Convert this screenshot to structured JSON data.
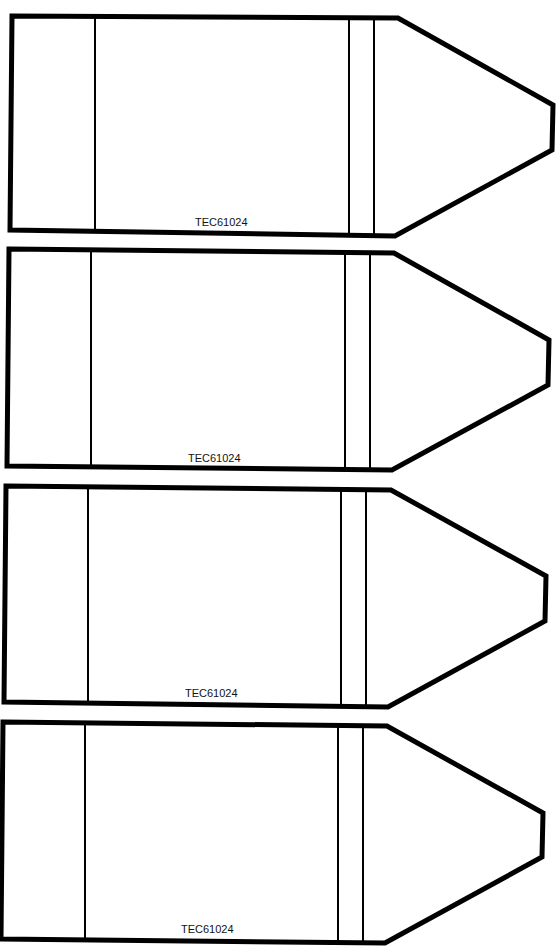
{
  "sheet": {
    "background": "#ffffff",
    "stroke_color": "#000000"
  },
  "crayons": [
    {
      "label": "TEC61024"
    },
    {
      "label": "TEC61024"
    },
    {
      "label": "TEC61024"
    },
    {
      "label": "TEC61024"
    }
  ]
}
